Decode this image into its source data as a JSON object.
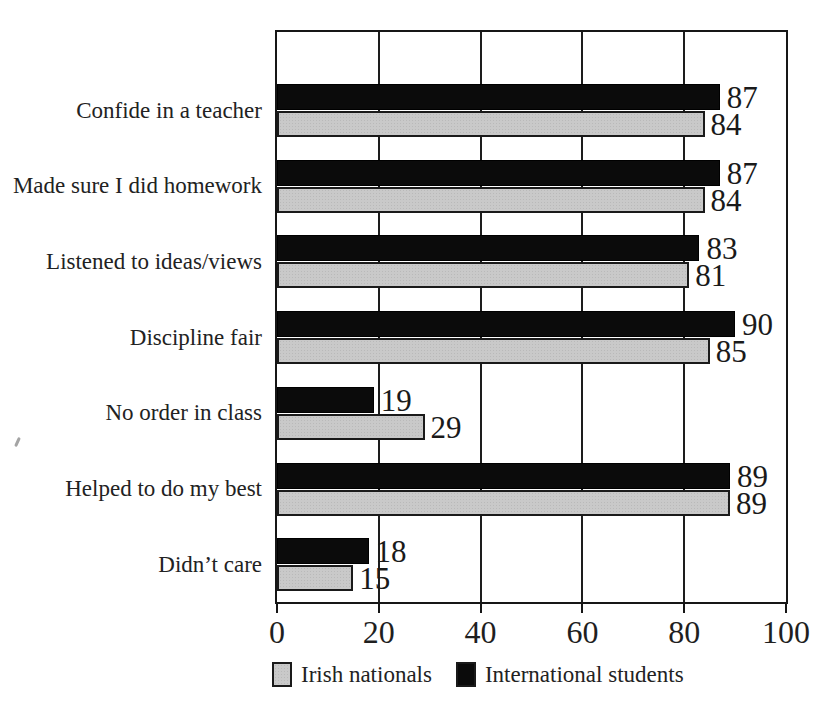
{
  "chart_data": {
    "type": "bar",
    "orientation": "horizontal",
    "title": "",
    "categories": [
      "Confide in a teacher",
      "Made sure I did homework",
      "Listened to ideas/views",
      "Discipline fair",
      "No order in class",
      "Helped to do my best",
      "Didn’t care"
    ],
    "series": [
      {
        "name": "International students",
        "color": "#0b0b0b",
        "values": [
          87,
          87,
          83,
          90,
          19,
          89,
          18
        ]
      },
      {
        "name": "Irish nationals",
        "color": "#c9c9c9",
        "values": [
          84,
          84,
          81,
          85,
          29,
          89,
          15
        ]
      }
    ],
    "value_labels_shown": true,
    "x_axis": {
      "min": 0,
      "max": 100,
      "ticks": [
        "0",
        "20",
        "40",
        "60",
        "80",
        "100"
      ]
    },
    "grid": "vertical",
    "legend": {
      "position": "bottom",
      "items": [
        {
          "label": "Irish nationals",
          "color": "#c9c9c9",
          "style": "halftone-gray"
        },
        {
          "label": "International students",
          "color": "#0b0b0b",
          "style": "solid-black"
        }
      ]
    }
  }
}
